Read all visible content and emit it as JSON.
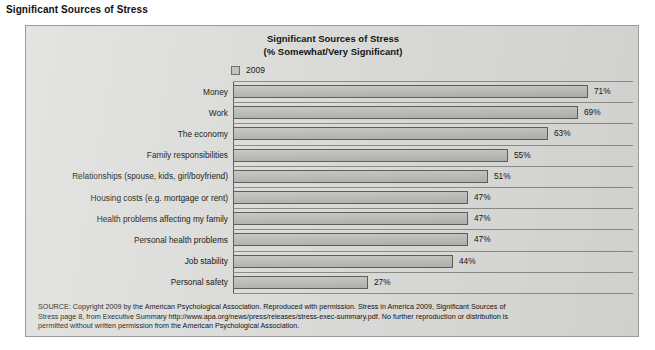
{
  "page": {
    "heading": "Significant Sources of Stress"
  },
  "chart": {
    "title_line1": "Significant Sources of Stress",
    "title_line2": "(% Somewhat/Very Significant)",
    "legend": {
      "swatch_icon": "legend-swatch-icon",
      "label": "2009"
    },
    "colors": {
      "panel_background": "#dcdcda",
      "panel_border": "#9a9a97",
      "bar_fill": "#bcbcb9",
      "bar_border": "#5f5f5c",
      "gridline": "#8d8d8a",
      "text": "#15150f"
    }
  },
  "chart_data": {
    "type": "bar",
    "orientation": "horizontal",
    "title": "Significant Sources of Stress (% Somewhat/Very Significant)",
    "xlabel": "",
    "ylabel": "",
    "xlim": [
      0,
      80
    ],
    "grid": true,
    "legend_position": "top-left",
    "series": [
      {
        "name": "2009",
        "values": [
          71,
          69,
          63,
          55,
          51,
          47,
          47,
          47,
          44,
          27
        ]
      }
    ],
    "categories": [
      "Money",
      "Work",
      "The economy",
      "Family responsibilities",
      "Relationships (spouse, kids, girl/boyfriend)",
      "Housing costs (e.g. mortgage or rent)",
      "Health problems affecting my family",
      "Personal health problems",
      "Job stability",
      "Personal safety"
    ],
    "data_labels": [
      "71%",
      "69%",
      "63%",
      "55%",
      "51%",
      "47%",
      "47%",
      "47%",
      "44%",
      "27%"
    ]
  },
  "source_note": {
    "line1": "SOURCE: Copyright 2009 by the American Psychological Association.  Reproduced with permission. Stress in America 2009, Significant Sources of",
    "line2": "Stress page 8, from Executive Summary http://www.apa.org/news/press/releases/stress-exec-summary.pdf. No further reproduction or distribution is",
    "line3": "permitted without written permission from the American Psychological Association."
  }
}
